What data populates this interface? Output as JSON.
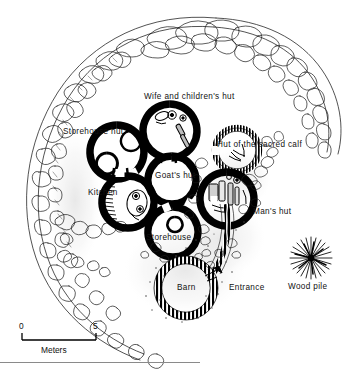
{
  "figure": {
    "type": "archaeological-site-plan",
    "background_color": "#ffffff",
    "ink_color": "#000000"
  },
  "labels": [
    {
      "id": "wife-and-childrens-hut",
      "text": "Wife and children's hut",
      "x": 144,
      "y": 98
    },
    {
      "id": "storehouse-hut",
      "text": "Storehouse hut",
      "x": 63,
      "y": 133
    },
    {
      "id": "hut-of-the-sacred-calf",
      "text": "Hut of the sacred calf",
      "x": 217,
      "y": 146
    },
    {
      "id": "goats-hut",
      "text": "Goat's hut",
      "x": 155,
      "y": 177
    },
    {
      "id": "kitchen",
      "text": "Kitchen",
      "x": 88,
      "y": 194
    },
    {
      "id": "mans-hut",
      "text": "Man's hut",
      "x": 253,
      "y": 213
    },
    {
      "id": "storehouse",
      "text": "Storehouse",
      "x": 146,
      "y": 239
    },
    {
      "id": "barn",
      "text": "Barn",
      "x": 185,
      "y": 289
    },
    {
      "id": "entrance",
      "text": "Entrance",
      "x": 229,
      "y": 289
    },
    {
      "id": "wood-pile",
      "text": "Wood pile",
      "x": 290,
      "y": 288
    }
  ],
  "scale_bar": {
    "start_label": "0",
    "end_label": "5",
    "unit_label": "Meters",
    "start_x": 22,
    "end_x": 96,
    "y": 340
  },
  "features": {
    "enclosure": "stone and thorn boundary fence",
    "huts": [
      {
        "name": "Storehouse hut",
        "cx": 117,
        "cy": 152,
        "r": 27,
        "wall": "solid"
      },
      {
        "name": "Wife and children's hut",
        "cx": 170,
        "cy": 131,
        "r": 27,
        "wall": "solid"
      },
      {
        "name": "Hut of the sacred calf",
        "cx": 237,
        "cy": 150,
        "r": 22,
        "wall": "hatched"
      },
      {
        "name": "Goat's hut",
        "cx": 172,
        "cy": 180,
        "r": 24,
        "wall": "solid"
      },
      {
        "name": "Kitchen",
        "cx": 128,
        "cy": 202,
        "r": 26,
        "wall": "solid"
      },
      {
        "name": "Man's hut",
        "cx": 227,
        "cy": 199,
        "r": 27,
        "wall": "solid"
      },
      {
        "name": "Storehouse",
        "cx": 173,
        "cy": 232,
        "r": 25,
        "wall": "solid"
      },
      {
        "name": "Barn",
        "cx": 186,
        "cy": 288,
        "r": 28,
        "wall": "hatched"
      }
    ],
    "wood_pile": {
      "cx": 311,
      "cy": 258,
      "r": 20,
      "style": "radial-starburst"
    }
  }
}
